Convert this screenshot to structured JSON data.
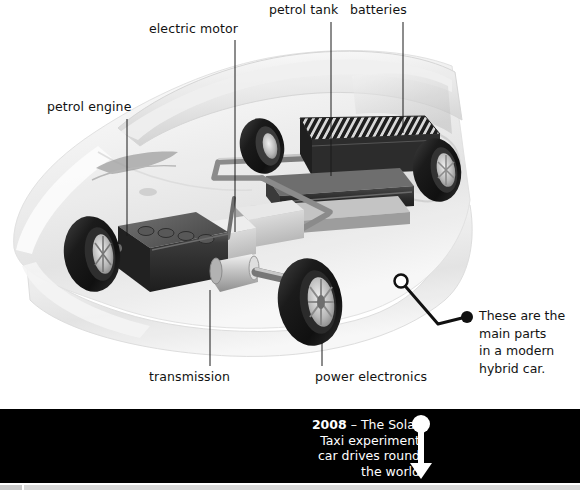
{
  "diagram": {
    "title_alt": "Cutaway illustration of a hybrid car chassis",
    "labels": {
      "electric_motor": "electric motor",
      "petrol_tank": "petrol tank",
      "batteries": "batteries",
      "petrol_engine": "petrol engine",
      "transmission": "transmission",
      "power_electronics": "power electronics"
    },
    "annotation": {
      "line1": "These are the",
      "line2": "main parts",
      "line3": "in a modern",
      "line4": "hybrid car."
    },
    "colors": {
      "background": "#ffffff",
      "text": "#121212",
      "leader_line": "#1a1a1a",
      "body_ghost": "#e9e9e9",
      "chassis_dark": "#2b2b2b",
      "chassis_mid": "#8e8e8e",
      "chassis_light": "#d2d2d2",
      "tyre": "#1c1c1c"
    }
  },
  "timeline": {
    "year": "2008",
    "line1_rest": " – The Solar",
    "line2": "Taxi experiment",
    "line3": "car drives round",
    "line4": "the world",
    "band_color": "#000000",
    "text_color": "#ffffff",
    "marker_icon": "circle-with-down-arrow-icon"
  }
}
